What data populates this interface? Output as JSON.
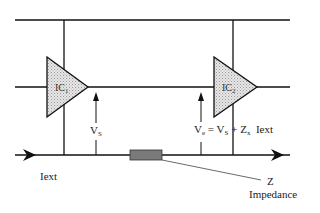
{
  "diagram": {
    "type": "circuit-schematic",
    "components": {
      "ic1": {
        "label": "IC",
        "subscript": "1"
      },
      "ic2": {
        "label": "IC",
        "subscript": "2"
      },
      "impedance": {
        "symbol": "Z",
        "label": "Impedance"
      }
    },
    "labels": {
      "vs": {
        "main": "V",
        "sub": "S"
      },
      "ve_equation": {
        "lhs_main": "V",
        "lhs_sub": "e",
        "eq": " = ",
        "term1_main": "V",
        "term1_sub": "S",
        "plus": " + ",
        "term2_main": "Z",
        "term2_sub": "x",
        "term3": "  Iext"
      },
      "iext": "Iext",
      "z": "Z",
      "impedance": "Impedance"
    },
    "colors": {
      "line": "#111111",
      "triangle_fill": "#cfcfcf",
      "impedance_fill": "#7a7a7a",
      "background": "#ffffff"
    }
  }
}
